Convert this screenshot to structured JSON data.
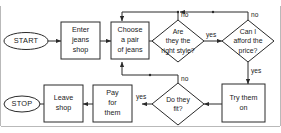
{
  "diagram": {
    "type": "flowchart",
    "colors": {
      "stroke": "#2a2a2a",
      "fill": "#ffffff",
      "text": "#1a1a1a",
      "frame": "#b9b9b9"
    },
    "nodes": {
      "start": {
        "label": "START",
        "shape": "terminator"
      },
      "enter_shop": {
        "line1": "Enter",
        "line2": "jeans",
        "line3": "shop",
        "shape": "process"
      },
      "choose_jeans": {
        "line1": "Choose",
        "line2": "a pair",
        "line3": "of jeans",
        "shape": "process"
      },
      "right_style": {
        "line1": "Are",
        "line2": "they the",
        "line3": "right style?",
        "shape": "decision"
      },
      "afford_price": {
        "line1": "Can I",
        "line2": "afford the",
        "line3": "price?",
        "shape": "decision"
      },
      "try_them_on": {
        "line1": "Try them",
        "line2": "on",
        "shape": "process"
      },
      "do_they_fit": {
        "line1": "Do they",
        "line2": "fit?",
        "shape": "decision"
      },
      "pay_for_them": {
        "line1": "Pay",
        "line2": "for",
        "line3": "them",
        "shape": "process"
      },
      "leave_shop": {
        "line1": "Leave",
        "line2": "shop",
        "shape": "process"
      },
      "stop": {
        "label": "STOP",
        "shape": "terminator"
      }
    },
    "edge_labels": {
      "style_no": "no",
      "style_yes": "yes",
      "afford_no": "no",
      "afford_yes": "yes",
      "fit_no": "no",
      "fit_yes": "yes"
    }
  }
}
